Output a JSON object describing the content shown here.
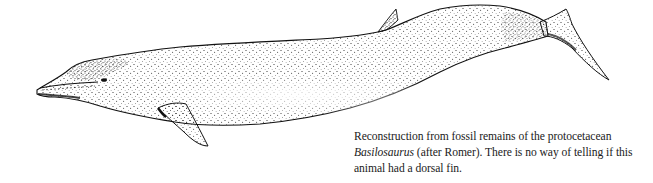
{
  "figure": {
    "ink_color": "#111111",
    "paper_color": "#ffffff"
  },
  "caption": {
    "line1": "Reconstruction from fossil remains of the protocetacean",
    "line2_italic": "Basilosaurus",
    "line2_rest": " (after Romer). There is no way of telling if this",
    "line3": "animal had a dorsal fin."
  }
}
